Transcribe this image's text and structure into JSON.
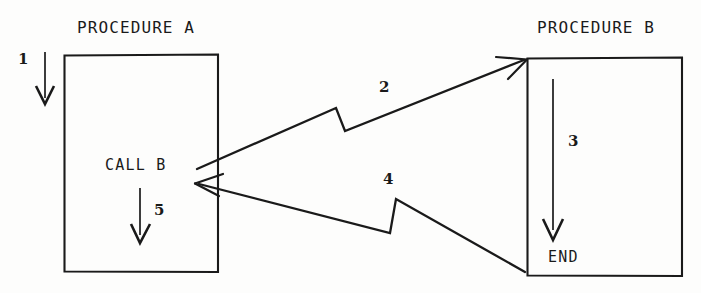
{
  "diagram": {
    "type": "flowchart-call-return",
    "title_a": "PROCEDURE A",
    "title_b": "PROCEDURE B",
    "call_label": "CALL B",
    "end_label": "END",
    "step_1": "1",
    "step_2": "2",
    "step_3": "3",
    "step_4": "4",
    "step_5": "5",
    "ink_color": "#1a1a1a",
    "paper_color": "#fdfdfc",
    "boxes": [
      {
        "name": "procedure-a-box",
        "x": 64,
        "y": 55,
        "w": 154,
        "h": 217
      },
      {
        "name": "procedure-b-box",
        "x": 527,
        "y": 58,
        "w": 155,
        "h": 218
      }
    ],
    "flow_steps": [
      {
        "id": "1",
        "from": "entry",
        "to": "procedure-a-box",
        "kind": "entry-arrow"
      },
      {
        "id": "2",
        "from": "call-b-statement",
        "to": "procedure-b-box-top",
        "kind": "call-arrow"
      },
      {
        "id": "3",
        "from": "procedure-b-box-top",
        "to": "end-statement",
        "kind": "internal-arrow"
      },
      {
        "id": "4",
        "from": "end-statement",
        "to": "call-b-statement",
        "kind": "return-arrow"
      },
      {
        "id": "5",
        "from": "call-b-statement",
        "to": "procedure-a-continue",
        "kind": "internal-arrow"
      }
    ]
  }
}
